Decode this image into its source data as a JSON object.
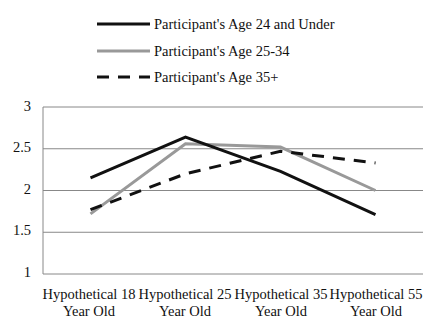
{
  "chart_data": {
    "type": "line",
    "title": "",
    "xlabel": "",
    "ylabel": "",
    "categories": [
      "Hypothetical 18 Year Old",
      "Hypothetical 25 Year Old",
      "Hypothetical 35 Year Old",
      "Hypothetical 55 Year Old"
    ],
    "category_lines": [
      [
        "Hypothetical 18",
        "Year Old"
      ],
      [
        "Hypothetical 25",
        "Year Old"
      ],
      [
        "Hypothetical 35",
        "Year Old"
      ],
      [
        "Hypothetical 55",
        "Year Old"
      ]
    ],
    "series": [
      {
        "name": "Participant's Age 24 and Under",
        "values": [
          2.15,
          2.64,
          2.23,
          1.71
        ],
        "color": "#111111",
        "style": "solid"
      },
      {
        "name": "Participant's Age 25-34",
        "values": [
          1.72,
          2.56,
          2.52,
          2.0
        ],
        "color": "#999999",
        "style": "solid"
      },
      {
        "name": "Participant's Age 35+",
        "values": [
          1.77,
          2.2,
          2.47,
          2.33
        ],
        "color": "#111111",
        "style": "dashed"
      }
    ],
    "ylim": [
      1,
      3
    ],
    "yticks": [
      "1",
      "1.5",
      "2",
      "2.5",
      "3"
    ],
    "grid": true,
    "legend_position": "top"
  },
  "legend": {
    "items": [
      {
        "label": "Participant's Age 24 and Under"
      },
      {
        "label": "Participant's Age 25-34"
      },
      {
        "label": "Participant's Age 35+"
      }
    ]
  },
  "axis": {
    "y_labels": [
      "3",
      "2.5",
      "2",
      "1.5",
      "1"
    ],
    "x_labels": [
      {
        "line1": "Hypothetical 18",
        "line2": "Year Old"
      },
      {
        "line1": "Hypothetical 25",
        "line2": "Year Old"
      },
      {
        "line1": "Hypothetical 35",
        "line2": "Year Old"
      },
      {
        "line1": "Hypothetical 55",
        "line2": "Year Old"
      }
    ]
  }
}
